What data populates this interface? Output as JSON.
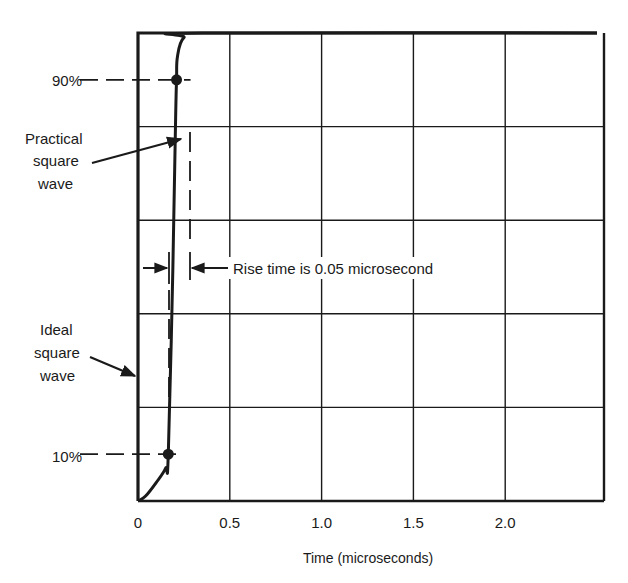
{
  "chart_data": {
    "type": "line",
    "title": "",
    "xlabel": "Time (microseconds)",
    "ylabel": "",
    "xlim": [
      0,
      2.5
    ],
    "ylim": [
      0,
      100
    ],
    "x_ticks": [
      {
        "value": 0,
        "label": "0"
      },
      {
        "value": 0.5,
        "label": "0.5"
      },
      {
        "value": 1.0,
        "label": "1.0"
      },
      {
        "value": 1.5,
        "label": "1.5"
      },
      {
        "value": 2.0,
        "label": "2.0"
      }
    ],
    "x_gridlines": [
      0.5,
      1.0,
      1.5,
      2.0
    ],
    "y_gridlines": [
      20,
      40,
      60,
      80
    ],
    "grid": true,
    "series": [
      {
        "name": "Practical square wave",
        "points": [
          [
            0.0,
            0
          ],
          [
            0.04,
            1
          ],
          [
            0.1,
            4
          ],
          [
            0.15,
            7
          ],
          [
            0.165,
            10
          ],
          [
            0.19,
            50
          ],
          [
            0.205,
            82
          ],
          [
            0.21,
            90
          ],
          [
            0.215,
            95
          ],
          [
            0.25,
            99
          ],
          [
            0.35,
            100
          ],
          [
            2.5,
            100
          ]
        ]
      },
      {
        "name": "Ideal square wave",
        "points": [
          [
            0,
            0
          ],
          [
            0,
            100
          ],
          [
            2.5,
            100
          ]
        ]
      }
    ],
    "markers": [
      {
        "label": "10%",
        "x": 0.165,
        "y": 10
      },
      {
        "label": "90%",
        "x": 0.21,
        "y": 90
      }
    ],
    "annotations": [
      {
        "id": "practical",
        "text_lines": [
          "Practical",
          "square",
          "wave"
        ]
      },
      {
        "id": "ideal",
        "text_lines": [
          "Ideal",
          "square",
          "wave"
        ]
      },
      {
        "id": "rise",
        "text": "Rise time is 0.05 microsecond",
        "y": 50
      }
    ]
  },
  "labels": {
    "pct90": "90%",
    "pct10": "10%",
    "practical": [
      "Practical",
      "square",
      "wave"
    ],
    "ideal": [
      "Ideal",
      "square",
      "wave"
    ],
    "rise_time": "Rise time is 0.05 microsecond",
    "x_axis_title": "Time (microseconds)"
  },
  "colors": {
    "ink": "#1a1a1a",
    "background": "#ffffff"
  }
}
